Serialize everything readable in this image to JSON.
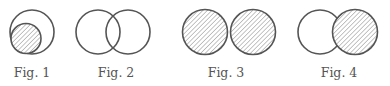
{
  "diagram": {
    "type": "venn-set-relations",
    "colors": {
      "stroke": "#555555",
      "hatch": "#8a8a8a",
      "background": "#ffffff"
    },
    "figures": [
      {
        "label": "Fig. 1",
        "relation": "subset",
        "description": "Small hatched circle contained inside a larger unshaded circle"
      },
      {
        "label": "Fig. 2",
        "relation": "overlap",
        "description": "Two unshaded circles overlapping"
      },
      {
        "label": "Fig. 3",
        "relation": "disjoint-touching",
        "description": "Two hatched circles side by side, touching"
      },
      {
        "label": "Fig. 4",
        "relation": "adjacent-one-shaded",
        "description": "Unshaded left circle and hatched right circle, slightly overlapping"
      }
    ]
  }
}
